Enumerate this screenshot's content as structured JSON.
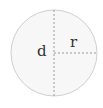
{
  "diagram": {
    "circle": {
      "cx": 54,
      "cy": 53,
      "r": 43,
      "fill": "#f7f7f7",
      "stroke": "#cfcfcf"
    },
    "diameter": {
      "label": "d",
      "color": "#9a9a9a"
    },
    "radius": {
      "label": "r",
      "color": "#9a9a9a"
    }
  }
}
